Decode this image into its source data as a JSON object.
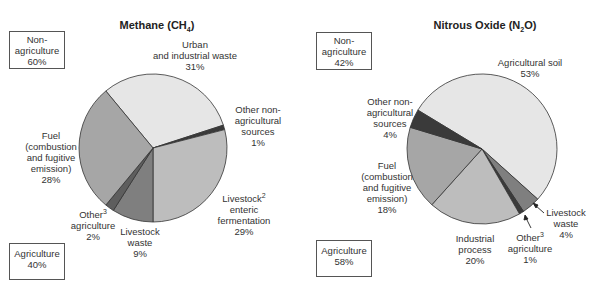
{
  "chart_data": [
    {
      "type": "pie",
      "title": "Methane (CH4)",
      "title_main": "Methane (CH",
      "title_sub": "4",
      "title_end": ")",
      "start_angle_deg": 320.4,
      "slices": [
        {
          "label": "Urban and industrial waste",
          "value": 31,
          "color": "#e6e6e6",
          "group": "Non-agriculture"
        },
        {
          "label": "Other non-agricultural sources",
          "value": 1,
          "color": "#3a3a3a",
          "group": "Non-agriculture"
        },
        {
          "label": "Livestock enteric fermentation",
          "value": 29,
          "color": "#bdbdbd",
          "group": "Agriculture"
        },
        {
          "label": "Livestock waste",
          "value": 9,
          "color": "#7f7f7f",
          "group": "Agriculture"
        },
        {
          "label": "Other agriculture",
          "value": 2,
          "color": "#5e5e5e",
          "group": "Agriculture"
        },
        {
          "label": "Fuel (combustion and fugitive emission)",
          "value": 28,
          "color": "#a6a6a6",
          "group": "Non-agriculture"
        }
      ],
      "groups": [
        {
          "label": "Non-agriculture",
          "value": 60
        },
        {
          "label": "Agriculture",
          "value": 40
        }
      ]
    },
    {
      "type": "pie",
      "title": "Nitrous Oxide (N2O)",
      "title_main": "Nitrous Oxide (N",
      "title_sub": "2",
      "title_end": "O)",
      "start_angle_deg": 301.2,
      "slices": [
        {
          "label": "Agricultural soil",
          "value": 53,
          "color": "#e6e6e6",
          "group": "Agriculture"
        },
        {
          "label": "Livestock waste",
          "value": 4,
          "color": "#7f7f7f",
          "group": "Agriculture"
        },
        {
          "label": "Other agriculture",
          "value": 1,
          "color": "#3a3a3a",
          "group": "Agriculture"
        },
        {
          "label": "Industrial process",
          "value": 20,
          "color": "#bdbdbd",
          "group": "Non-agriculture"
        },
        {
          "label": "Fuel (combustion and fugitive emission)",
          "value": 18,
          "color": "#a6a6a6",
          "group": "Non-agriculture"
        },
        {
          "label": "Other non-agricultural sources",
          "value": 4,
          "color": "#3a3a3a",
          "group": "Non-agriculture"
        }
      ],
      "groups": [
        {
          "label": "Non-agriculture",
          "value": 42
        },
        {
          "label": "Agriculture",
          "value": 58
        }
      ]
    }
  ],
  "methane": {
    "title_main": "Methane (CH",
    "title_sub": "4",
    "title_end": ")",
    "box_nonag": {
      "l1": "Non-",
      "l2": "agriculture",
      "l3": "60%"
    },
    "box_ag": {
      "l1": "Agriculture",
      "l2": "40%"
    },
    "urban": {
      "l1": "Urban",
      "l2": "and industrial waste",
      "l3": "31%"
    },
    "othernonag": {
      "l1": "Other non-",
      "l2": "agricultural",
      "l3": "sources",
      "l4": "1%"
    },
    "fuel": {
      "l1": "Fuel",
      "l2": "(combustion",
      "l3": "and fugitive",
      "l4": "emission)",
      "l5": "28%"
    },
    "enteric": {
      "l1": "Livestock",
      "sup": "2",
      "l2": "enteric",
      "l3": "fermentation",
      "l4": "29%"
    },
    "otherag": {
      "l1": "Other",
      "sup": "3",
      "l2": "agriculture",
      "l3": "2%"
    },
    "waste": {
      "l1": "Livestock",
      "l2": "waste",
      "l3": "9%"
    }
  },
  "n2o": {
    "title_main": "Nitrous Oxide (N",
    "title_sub": "2",
    "title_end": "O)",
    "box_nonag": {
      "l1": "Non-",
      "l2": "agriculture",
      "l3": "42%"
    },
    "box_ag": {
      "l1": "Agriculture",
      "l2": "58%"
    },
    "soil": {
      "l1": "Agricultural soil",
      "l2": "53%"
    },
    "othernonag": {
      "l1": "Other non-",
      "l2": "agricultural",
      "l3": "sources",
      "l4": "4%"
    },
    "fuel": {
      "l1": "Fuel",
      "l2": "(combustion",
      "l3": "and fugitive",
      "l4": "emission)",
      "l5": "18%"
    },
    "industrial": {
      "l1": "Industrial",
      "l2": "process",
      "l3": "20%"
    },
    "otherag": {
      "l1": "Other",
      "sup": "3",
      "l2": "agriculture",
      "l3": "1%"
    },
    "waste": {
      "l1": "Livestock",
      "l2": "waste",
      "l3": "4%"
    }
  }
}
